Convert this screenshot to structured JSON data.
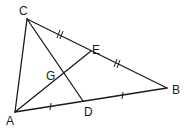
{
  "diagram": {
    "type": "triangle-medians",
    "points": {
      "A": {
        "label": "A"
      },
      "B": {
        "label": "B"
      },
      "C": {
        "label": "C"
      },
      "D": {
        "label": "D"
      },
      "E": {
        "label": "E"
      },
      "G": {
        "label": "G"
      }
    },
    "segments": [
      "AB",
      "BC",
      "CA",
      "CD",
      "AE"
    ],
    "equal_marks": [
      {
        "segments": [
          "AD",
          "DB"
        ],
        "ticks": 1
      },
      {
        "segments": [
          "CE",
          "EB"
        ],
        "ticks": 2
      }
    ],
    "line_color": "#1a1a1a"
  }
}
